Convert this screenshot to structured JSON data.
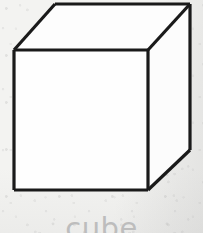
{
  "figure": {
    "name": "cube-line-drawing",
    "caption": "cube",
    "caption_color": "#bdbdbd",
    "background_color": "#f3f3f1",
    "line_color": "#1a1a1a",
    "face_color": "#fdfdfd",
    "line_width": 3,
    "shape": "cube",
    "projection": "oblique",
    "canvas": {
      "width": 203,
      "height": 233
    },
    "vertices": {
      "front_top_left": [
        14,
        50
      ],
      "front_top_right": [
        148,
        50
      ],
      "front_bottom_right": [
        148,
        190
      ],
      "front_bottom_left": [
        14,
        190
      ],
      "back_top_left": [
        55,
        4
      ],
      "back_top_right": [
        190,
        4
      ],
      "back_bottom_right": [
        190,
        150
      ]
    },
    "faces": [
      {
        "name": "front-face",
        "points": "14,50 148,50 148,190 14,190"
      },
      {
        "name": "top-face",
        "points": "14,50 55,4 190,4 148,50"
      },
      {
        "name": "right-face",
        "points": "148,50 190,4 190,150 148,190"
      }
    ],
    "edges": [
      {
        "name": "front-top-edge",
        "from": [
          14,
          50
        ],
        "to": [
          148,
          50
        ]
      },
      {
        "name": "front-right-edge",
        "from": [
          148,
          50
        ],
        "to": [
          148,
          190
        ]
      },
      {
        "name": "front-bottom-edge",
        "from": [
          148,
          190
        ],
        "to": [
          14,
          190
        ]
      },
      {
        "name": "front-left-edge",
        "from": [
          14,
          190
        ],
        "to": [
          14,
          50
        ]
      },
      {
        "name": "top-left-receding-edge",
        "from": [
          14,
          50
        ],
        "to": [
          55,
          4
        ]
      },
      {
        "name": "back-top-edge",
        "from": [
          55,
          4
        ],
        "to": [
          190,
          4
        ]
      },
      {
        "name": "top-right-receding-edge",
        "from": [
          190,
          4
        ],
        "to": [
          148,
          50
        ]
      },
      {
        "name": "back-right-vertical-edge",
        "from": [
          190,
          4
        ],
        "to": [
          190,
          150
        ]
      },
      {
        "name": "bottom-right-receding-edge",
        "from": [
          190,
          150
        ],
        "to": [
          148,
          190
        ]
      }
    ]
  }
}
